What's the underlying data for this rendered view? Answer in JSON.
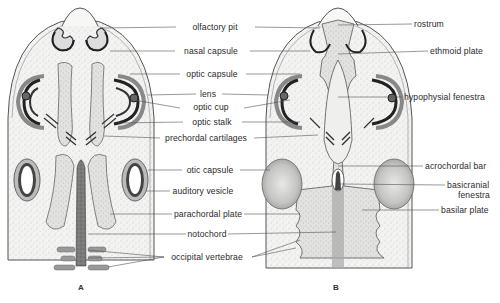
{
  "figure": {
    "panels": [
      {
        "id": "A",
        "label": "A"
      },
      {
        "id": "B",
        "label": "B"
      }
    ]
  },
  "labels_center": [
    {
      "text": "olfactory pit",
      "x": 215,
      "y": 22
    },
    {
      "text": "nasal capsule",
      "x": 211,
      "y": 46
    },
    {
      "text": "optic capsule",
      "x": 212,
      "y": 69
    },
    {
      "text": "lens",
      "x": 208,
      "y": 89
    },
    {
      "text": "optic cup",
      "x": 211,
      "y": 102
    },
    {
      "text": "optic stalk",
      "x": 212,
      "y": 117
    },
    {
      "text": "prechordal cartilages",
      "x": 206,
      "y": 133
    },
    {
      "text": "otic capsule",
      "x": 210,
      "y": 165
    },
    {
      "text": "auditory vesicle",
      "x": 203,
      "y": 186
    },
    {
      "text": "parachordal plate",
      "x": 208,
      "y": 209
    },
    {
      "text": "notochord",
      "x": 207,
      "y": 229
    },
    {
      "text": "occipital vertebrae",
      "x": 207,
      "y": 252
    }
  ],
  "labels_right": [
    {
      "text": "rostrum",
      "x": 414,
      "y": 19
    },
    {
      "text": "ethmoid plate",
      "x": 430,
      "y": 46
    },
    {
      "text": "hypophysial fenestra",
      "x": 404,
      "y": 92
    },
    {
      "text": "acrochordal bar",
      "x": 425,
      "y": 161
    },
    {
      "text": "basicranial",
      "x": 447,
      "y": 180
    },
    {
      "text": "fenestra",
      "x": 458,
      "y": 190
    },
    {
      "text": "basilar plate",
      "x": 441,
      "y": 205
    }
  ]
}
